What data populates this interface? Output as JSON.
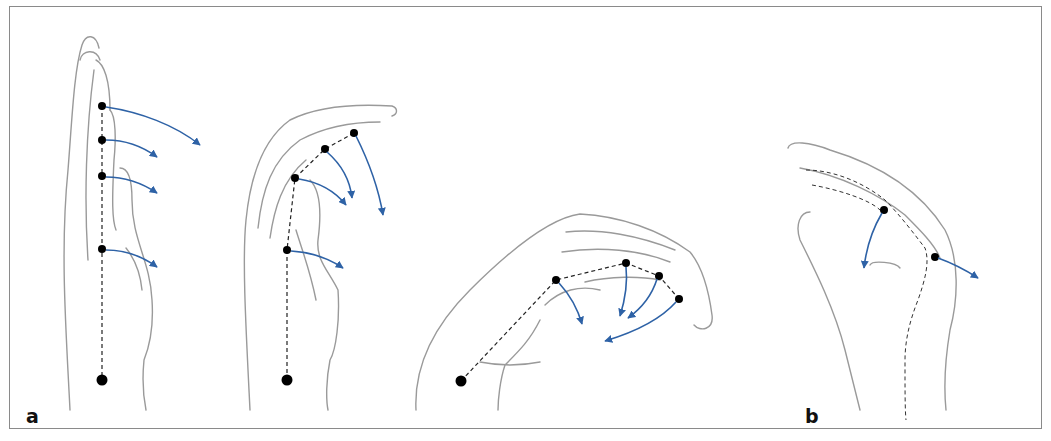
{
  "figure": {
    "panel_labels": {
      "a": "a",
      "b": "b"
    },
    "colors": {
      "arrow": "#2e62a6",
      "outline": "#9a9a9a",
      "joint": "#000000",
      "frame": "#8a8a8a"
    },
    "panels": [
      {
        "id": "a1",
        "description": "Extended finger, lateral view, four joints with flexion arrows"
      },
      {
        "id": "a2",
        "description": "Partially flexed finger with flexion arrows"
      },
      {
        "id": "a3",
        "description": "Fully flexed finger with flexion arrows"
      },
      {
        "id": "b",
        "description": "Thumb with two joints, flexion and extension arrows"
      }
    ]
  }
}
